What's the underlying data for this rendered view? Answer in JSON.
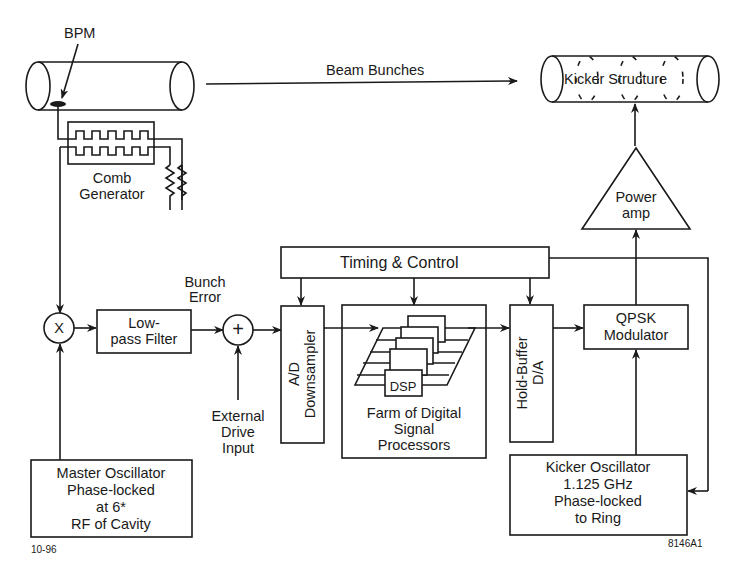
{
  "diagram": {
    "labels": {
      "bpm": "BPM",
      "beam_bunches": "Beam Bunches",
      "kicker_structure": "Kicker Structure",
      "comb_generator": [
        "Comb",
        "Generator"
      ],
      "power_amp": [
        "Power",
        "amp"
      ],
      "timing_control": "Timing & Control",
      "bunch_error": [
        "Bunch",
        "Error"
      ],
      "mixer_symbol": "X",
      "summer_symbol": "+",
      "lowpass_filter": [
        "Low-",
        "pass Filter"
      ],
      "external_drive": [
        "External",
        "Drive",
        "Input"
      ],
      "ad_downsampler": [
        "A/D",
        "Downsampler"
      ],
      "dsp": "DSP",
      "dsp_farm": [
        "Farm of Digital",
        "Signal",
        "Processors"
      ],
      "hold_buffer": [
        "Hold-Buffer",
        "D/A"
      ],
      "qpsk": [
        "QPSK",
        "Modulator"
      ],
      "master_osc": [
        "Master Oscillator",
        "Phase-locked",
        "at 6*",
        "RF of Cavity"
      ],
      "kicker_osc": [
        "Kicker Oscillator",
        "1.125 GHz",
        "Phase-locked",
        "to Ring"
      ],
      "date_code": "10-96",
      "figure_code": "8146A1"
    },
    "connections": [
      {
        "from": "BPM",
        "to": "Comb Generator"
      },
      {
        "from": "Comb Generator",
        "to": "Mixer"
      },
      {
        "from": "Master Oscillator",
        "to": "Mixer"
      },
      {
        "from": "Mixer",
        "to": "Low-pass Filter"
      },
      {
        "from": "Low-pass Filter",
        "to": "Summer",
        "label": "Bunch Error"
      },
      {
        "from": "External Drive Input",
        "to": "Summer"
      },
      {
        "from": "Summer",
        "to": "A/D Downsampler"
      },
      {
        "from": "A/D Downsampler",
        "to": "Farm of Digital Signal Processors"
      },
      {
        "from": "Farm of Digital Signal Processors",
        "to": "Hold-Buffer D/A"
      },
      {
        "from": "Hold-Buffer D/A",
        "to": "QPSK Modulator"
      },
      {
        "from": "Kicker Oscillator",
        "to": "QPSK Modulator"
      },
      {
        "from": "QPSK Modulator",
        "to": "Power amp"
      },
      {
        "from": "Power amp",
        "to": "Kicker Structure"
      },
      {
        "from": "Timing & Control",
        "to": "A/D Downsampler"
      },
      {
        "from": "Timing & Control",
        "to": "Farm of Digital Signal Processors"
      },
      {
        "from": "Timing & Control",
        "to": "Hold-Buffer D/A"
      },
      {
        "from": "Timing & Control",
        "to": "Kicker Oscillator"
      },
      {
        "from": "Beam pipe",
        "to": "Kicker Structure",
        "label": "Beam Bunches"
      }
    ]
  }
}
